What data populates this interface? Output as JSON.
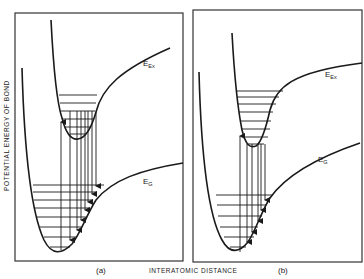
{
  "figure": {
    "y_axis_label": "POTENTIAL ENERGY OF BOND",
    "x_axis_label": "INTERATOMIC DISTANCE",
    "panels": [
      {
        "id": "a",
        "label": "(a)",
        "excited_curve": {
          "symbol": "E",
          "subscript": "Ex"
        },
        "ground_curve": {
          "symbol": "E",
          "subscript": "G"
        },
        "excited_vibrational_levels": 5,
        "ground_vibrational_levels": 7,
        "description": "Excited-state well displaced to larger interatomic distance; absorption arrow up from ground minimum, multiple emission arrows down to upper ground vibrational levels"
      },
      {
        "id": "b",
        "label": "(b)",
        "excited_curve": {
          "symbol": "E",
          "subscript": "Ex"
        },
        "ground_curve": {
          "symbol": "E",
          "subscript": "G"
        },
        "excited_vibrational_levels": 7,
        "ground_vibrational_levels": 5,
        "description": "Excited-state well nearly aligned with ground-state well; absorption arrow up, emission arrows down to lower ground vibrational levels"
      }
    ],
    "stroke_color": "#1a1a1a",
    "background_color": "#ffffff"
  }
}
